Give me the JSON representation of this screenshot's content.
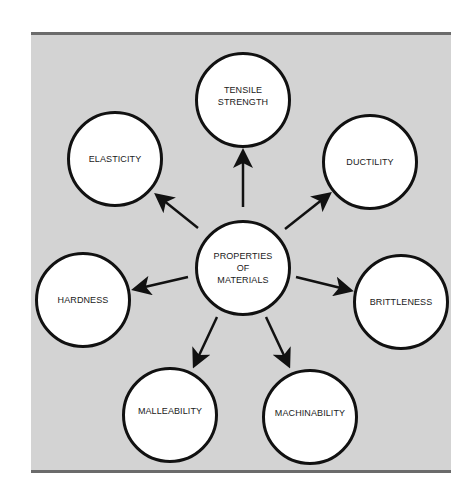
{
  "diagram": {
    "center": {
      "label": "PROPERTIES\nOF\nMATERIALS",
      "x": 243,
      "y": 268
    },
    "nodes": [
      {
        "id": "tensile-strength",
        "label": "TENSILE\nSTRENGTH",
        "x": 243,
        "y": 100
      },
      {
        "id": "ductility",
        "label": "DUCTILITY",
        "x": 370,
        "y": 162
      },
      {
        "id": "brittleness",
        "label": "BRITTLENESS",
        "x": 401,
        "y": 302
      },
      {
        "id": "machinability",
        "label": "MACHINABILITY",
        "x": 310,
        "y": 417
      },
      {
        "id": "malleability",
        "label": "MALLEABILITY",
        "x": 170,
        "y": 415
      },
      {
        "id": "hardness",
        "label": "HARDNESS",
        "x": 83,
        "y": 300
      },
      {
        "id": "elasticity",
        "label": "ELASTICITY",
        "x": 115,
        "y": 159
      }
    ],
    "edges": [
      {
        "from": "center",
        "to": "tensile-strength",
        "x1": 243,
        "y1": 207,
        "x2": 243,
        "y2": 153
      },
      {
        "from": "center",
        "to": "ductility",
        "x1": 285,
        "y1": 229,
        "x2": 328,
        "y2": 195
      },
      {
        "from": "center",
        "to": "brittleness",
        "x1": 296,
        "y1": 277,
        "x2": 349,
        "y2": 290
      },
      {
        "from": "center",
        "to": "machinability",
        "x1": 266,
        "y1": 317,
        "x2": 288,
        "y2": 364
      },
      {
        "from": "center",
        "to": "malleability",
        "x1": 217,
        "y1": 317,
        "x2": 195,
        "y2": 364
      },
      {
        "from": "center",
        "to": "hardness",
        "x1": 188,
        "y1": 277,
        "x2": 136,
        "y2": 289
      },
      {
        "from": "center",
        "to": "elasticity",
        "x1": 198,
        "y1": 228,
        "x2": 158,
        "y2": 196
      }
    ],
    "colors": {
      "panel": "#d3d3d3",
      "border": "#6b6b6b",
      "stroke": "#111111",
      "node_fill": "#ffffff"
    }
  }
}
